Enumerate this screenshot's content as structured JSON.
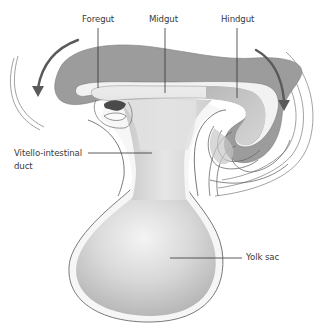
{
  "diagram": {
    "labels": {
      "foregut": "Foregut",
      "midgut": "Midgut",
      "hindgut": "Hindgut",
      "vitello_line1": "Vitello-intestinal",
      "vitello_line2": "duct",
      "yolk_sac": "Yolk sac"
    },
    "arrows": {
      "left": "counter-clockwise folding arrow (left)",
      "right": "clockwise folding arrow (right)"
    },
    "colors": {
      "background": "#ffffff",
      "outline": "#6a6a6a",
      "dark_gray_fill": "#9a9a9a",
      "gut_fill": "#dcdcdc",
      "yolk_fill": "#cfcfcf",
      "arrow": "#5a5a5a",
      "text": "#3a3a3a"
    }
  }
}
